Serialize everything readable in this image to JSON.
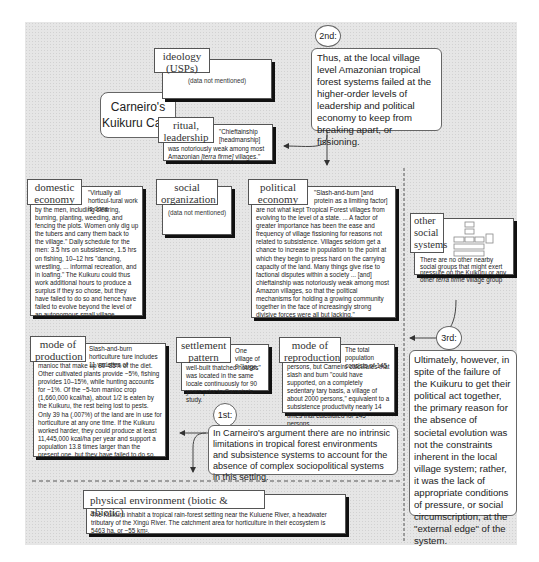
{
  "title": "Carneiro's Kuikuru Case",
  "title_lines": [
    "Carneiro's",
    "Kuikuru Case"
  ],
  "steps": {
    "first": {
      "label": "1st:",
      "text": "In Carneiro's argument there are no intrinsic limitations in tropical forest environments and subsistence systems to account for the absence of complex sociopolitical systems in this setting."
    },
    "second": {
      "label": "2nd:",
      "text": "Thus, at the local village level Amazonian tropical forest systems failed at the higher-order levels of leadership and political economy to keep from breaking apart, or fissioning."
    },
    "third": {
      "label": "3rd:",
      "text": "Ultimately, however, in spite of the failure of the Kuikuru to get their political act together, the primary reason for the absence of societal evolution was not the constraints inherent in the local village system; rather, it was the lack of appropriate conditions of pressure, or social circumscription, at the \"external edge\" of the system."
    }
  },
  "boxes": {
    "ideology": {
      "label_lines": [
        "ideology",
        "(USPs)"
      ],
      "text": "(data not mentioned)"
    },
    "ritual": {
      "label_lines": [
        "ritual,",
        "leadership"
      ],
      "text_a": "\"Chieftainship [headmanship]",
      "text_b": "was notoriously weak among most Amazonian ",
      "text_italic": "[terra firme]",
      "text_c": " villages.\""
    },
    "domestic": {
      "label_lines": [
        "domestic",
        "economy"
      ],
      "text_head": "\"Virtually all horticul-tural work is done",
      "text_body": "by the men, including clearing, burning, planting, weeding, and fencing the plots. Women only dig up the tubers and carry them back to the village.\" Daily schedule for the men: 3.5 hrs on subsistence, 1.5 hrs on fishing, 10–12 hrs \"dancing, wrestling, ... informal recreation, and in loafing.\" The Kuikuru could thus work additional hours to produce a surplus if they so chose, but they have failed to do so and hence have failed to evolve beyond the level of an autonomous small village."
    },
    "social_org": {
      "label_lines": [
        "social",
        "organization"
      ],
      "text": "(data not mentioned)"
    },
    "political": {
      "label_lines": [
        "political",
        "economy"
      ],
      "text_head": "\"Slash-and-burn [and protein as a limiting factor]",
      "text_body": "are not what kept Tropical Forest villages from evolving to the level of a state. ... A factor of greater importance has been the ease and frequency of village fissioning for reasons not related to subsistence. Villages seldom get a chance to increase in population to the point at which they begin to press hard on the carrying capacity of the land. Many things give rise to factional disputes within a society ... [and] chieftainship was notoriously weak among most Amazon villages, so that the political mechanisms for holding a growing community together in the face of increasingly strong divisive forces were all but lacking.\""
    },
    "other_social": {
      "label_lines": [
        "other",
        "social",
        "systems"
      ],
      "text_a": "There are no other nearby social groups that might exert pressure on the Kuikuru or any other ",
      "text_italic": "terra firme",
      "text_c": " village group"
    },
    "production": {
      "label_lines": [
        "mode of",
        "production"
      ],
      "text_head": "Slash-and-burn horticulture ture includes 11 varieties of",
      "text_body": "manioc that make up 80–85% of the diet. Other cultivated plants provide ~5%, fishing provides 10–15%, while hunting accounts for ~1%. Of the ~5-ton manioc crop (1,660,000 kcal/ha), about 1/2 is eaten by the Kuikuru, the rest being lost to pests. Only 39 ha (.007%) of the land are in use for horticulture at any one time. If the Kuikuru worked harder, they could produce at least 11,445,000 kcal/ha per year and support a population 13.8 times larger than the present one, but they have failed to do so."
    },
    "settlement": {
      "label_lines": [
        "settlement",
        "pattern"
      ],
      "text_head": "One village of 9 \"large,",
      "text_body": "well-built thatched houses\" was located in the same locale continuously for 90 years prior to Carneiro's study."
    },
    "reproduction": {
      "label_lines": [
        "mode of",
        "reproduction"
      ],
      "text_head": "The total population consists of 145",
      "text_body": "persons, but Carneiro calculates that slash and burn \"could have supported, on a completely sedentary tary basis, a village of about 2000 persons,\" equivalent to a subsistence productivity nearly 14 times that calculated for 145 persons."
    },
    "physical": {
      "label": "physical environment (biotic & abiotic)",
      "text": "The Kuikuru inhabit a tropical rain-forest setting near the Kuluene River, a headwater tributary of the Xingú River. The catchment area for horticulture in their ecosystem is 5463 ha, or ~55 km²."
    }
  },
  "colors": {
    "background": "#e6e6e6",
    "card": "#ffffff",
    "border": "#555555",
    "shadow": "#111111",
    "line": "#444444"
  }
}
